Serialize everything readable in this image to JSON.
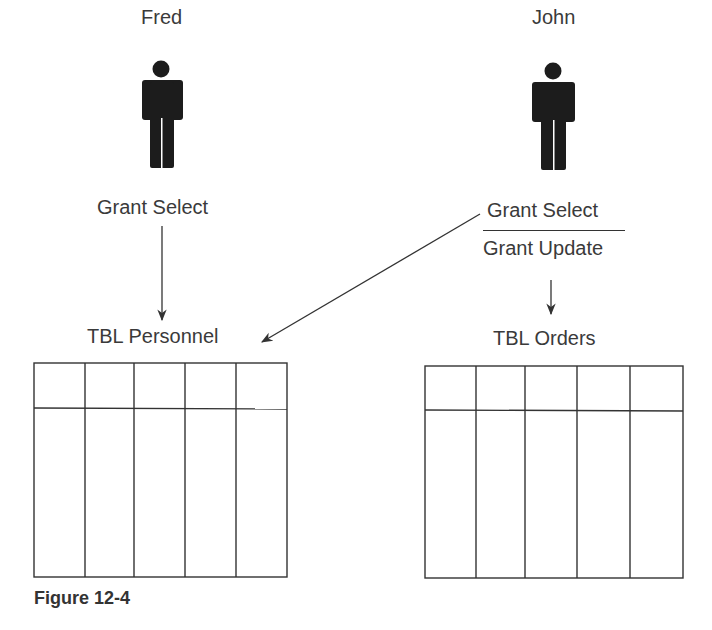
{
  "users": [
    {
      "name": "Fred",
      "grants": [
        "Grant Select"
      ]
    },
    {
      "name": "John",
      "grants": [
        "Grant Select",
        "Grant Update"
      ]
    }
  ],
  "tables": [
    {
      "name": "TBL Personnel",
      "columns": 5
    },
    {
      "name": "TBL Orders",
      "columns": 5
    }
  ],
  "caption": "Figure 12-4",
  "icons": {
    "user": "person-icon",
    "arrow": "arrow-down-icon"
  },
  "colors": {
    "ink": "#333333",
    "figure": "#1a1a1a",
    "background": "#ffffff"
  }
}
